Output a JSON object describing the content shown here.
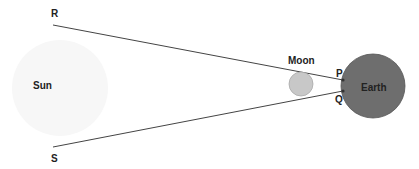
{
  "diagram": {
    "bodies": {
      "sun": {
        "label": "Sun",
        "color": "#f7f7f7"
      },
      "moon": {
        "label": "Moon",
        "color": "#c8c8c8",
        "stroke": "#aaaaaa"
      },
      "earth": {
        "label": "Earth",
        "color": "#6e6e6e",
        "stroke": "#555555"
      }
    },
    "points": {
      "R": "R",
      "S": "S",
      "P": "P",
      "Q": "Q"
    },
    "line_color": "#444444"
  }
}
